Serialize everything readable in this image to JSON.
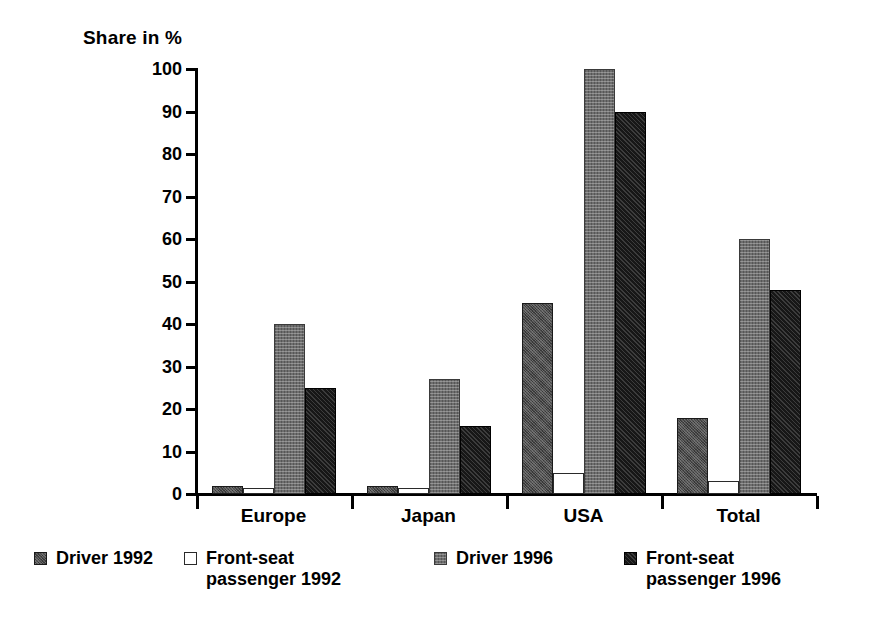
{
  "chart_data": {
    "type": "bar",
    "title": "Share in %",
    "xlabel": "",
    "ylabel": "Share in %",
    "ylim": [
      0,
      100
    ],
    "yticks": [
      0,
      10,
      20,
      30,
      40,
      50,
      60,
      70,
      80,
      90,
      100
    ],
    "grid": false,
    "legend_position": "bottom",
    "categories": [
      "Europe",
      "Japan",
      "USA",
      "Total"
    ],
    "series": [
      {
        "name": "Driver 1992",
        "values": [
          2,
          2,
          45,
          18
        ],
        "color": "#4a4a4a"
      },
      {
        "name": "Front-seat\npassenger 1992",
        "values": [
          1.5,
          1.5,
          5,
          3
        ],
        "color": "#ffffff"
      },
      {
        "name": "Driver 1996",
        "values": [
          40,
          27,
          100,
          60
        ],
        "color": "#6e6e6e"
      },
      {
        "name": "Front-seat\npassenger 1996",
        "values": [
          25,
          16,
          90,
          48
        ],
        "color": "#171717"
      }
    ]
  },
  "axis": {
    "title": "Share in %",
    "tick_labels": [
      "100",
      "90",
      "80",
      "70",
      "60",
      "50",
      "40",
      "30",
      "20",
      "10",
      "0"
    ]
  },
  "categories": [
    {
      "label": "Europe"
    },
    {
      "label": "Japan"
    },
    {
      "label": "USA"
    },
    {
      "label": "Total"
    }
  ],
  "legend": {
    "items": [
      {
        "label": "Driver 1992",
        "swatch": "legend-swatch-driver-1992"
      },
      {
        "label": "Front-seat\npassenger 1992",
        "swatch": "legend-swatch-front-seat-passenger-1992"
      },
      {
        "label": "Driver 1996",
        "swatch": "legend-swatch-driver-1996"
      },
      {
        "label": "Front-seat\npassenger 1996",
        "swatch": "legend-swatch-front-seat-passenger-1996"
      }
    ]
  }
}
